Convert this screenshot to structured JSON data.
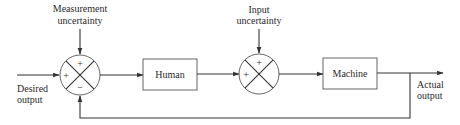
{
  "diagram": {
    "type": "block-diagram",
    "title": "",
    "blocks": [
      {
        "id": "human",
        "label": "Human"
      },
      {
        "id": "machine",
        "label": "Machine"
      }
    ],
    "summing_junctions": [
      {
        "id": "sum1",
        "signs": {
          "top": "+",
          "left": "+",
          "bottom": "−"
        },
        "input_label": "Measurement uncertainty"
      },
      {
        "id": "sum2",
        "signs": {
          "top": "+",
          "left": "+"
        },
        "input_label": "Input uncertainty"
      }
    ],
    "labels": {
      "measurement_line1": "Measurement",
      "measurement_line2": "uncertainty",
      "input_line1": "Input",
      "input_line2": "uncertainty",
      "desired_line1": "Desired",
      "desired_line2": "output",
      "actual_line1": "Actual",
      "actual_line2": "output"
    },
    "edges": [
      {
        "from": "desired-output",
        "to": "sum1"
      },
      {
        "from": "measurement-uncertainty",
        "to": "sum1"
      },
      {
        "from": "sum1",
        "to": "human"
      },
      {
        "from": "human",
        "to": "sum2"
      },
      {
        "from": "input-uncertainty",
        "to": "sum2"
      },
      {
        "from": "sum2",
        "to": "machine"
      },
      {
        "from": "machine",
        "to": "actual-output"
      },
      {
        "from": "actual-output",
        "to": "sum1",
        "type": "feedback"
      }
    ]
  }
}
